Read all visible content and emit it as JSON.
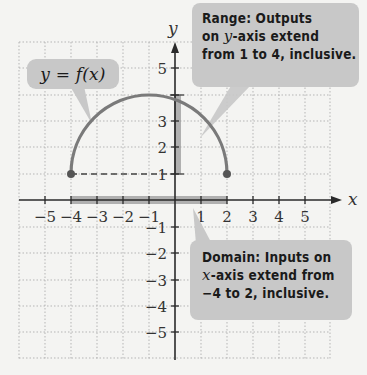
{
  "diagram": {
    "function_label": "y = f(x)",
    "axis_labels": {
      "x": "x",
      "y": "y"
    },
    "x_ticks": [
      "−5",
      "−4",
      "−3",
      "−2",
      "−1",
      "1",
      "2",
      "3",
      "4",
      "5"
    ],
    "y_ticks": [
      "5",
      "3",
      "2",
      "1",
      "−1",
      "−2",
      "−3",
      "−4",
      "−5"
    ],
    "range_callout": {
      "line1": "Range: Outputs",
      "line2_pre": "on ",
      "line2_var": "y",
      "line2_post": "-axis extend",
      "line3": "from 1 to 4, inclusive."
    },
    "domain_callout": {
      "line1": "Domain: Inputs on",
      "line2_var": "x",
      "line2_post": "-axis extend from",
      "line3": "−4 to 2, inclusive."
    },
    "curve": {
      "type": "semicircle-upper",
      "start_point": [
        -4,
        1
      ],
      "end_point": [
        2,
        1
      ],
      "max_point": [
        -1,
        4
      ]
    },
    "domain": [
      -4,
      2
    ],
    "range": [
      1,
      4
    ],
    "colors": {
      "curve": "#7a7a7a",
      "callout_bg": "#c8c8c8",
      "grid": "#b8b8b8",
      "axis": "#2a2a2a"
    }
  }
}
